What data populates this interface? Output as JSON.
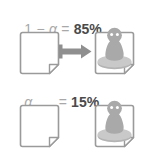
{
  "diagram": {
    "background_color": "#ffffff",
    "outline_color": "#9a9a9a",
    "figure_color": "#a9a9a9",
    "arrow_color": "#8f8f8f",
    "label_color": "#a8a8a8",
    "value_color": "#4a4a4a"
  },
  "rows": [
    {
      "id": "row-high-probability",
      "formula": {
        "lead": "1",
        "minus": " − ",
        "symbol": "α",
        "spacer": "",
        "equals": " = ",
        "value": "85%"
      },
      "source_icon": "document-blank-icon",
      "has_arrow": true,
      "arrow_icon": "arrow-right-icon",
      "target_icon": "document-person-icon"
    },
    {
      "id": "row-low-probability",
      "formula": {
        "lead": "",
        "minus": "",
        "symbol": "α",
        "spacer": "   ",
        "equals": " = ",
        "value": "15%"
      },
      "source_icon": "document-blank-icon",
      "has_arrow": false,
      "arrow_icon": "",
      "target_icon": "document-person-icon"
    }
  ]
}
